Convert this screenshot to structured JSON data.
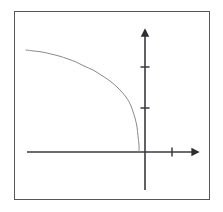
{
  "figure": {
    "title": "",
    "background_color": "#ffffff",
    "frame": {
      "name": "plot-border",
      "color": "#55555a",
      "x": 14,
      "y": 11,
      "width": 196,
      "height": 189
    }
  },
  "chart_data": {
    "type": "line",
    "title": "",
    "subtitle": "",
    "xlabel": "",
    "ylabel": "",
    "grid": false,
    "legend": "none",
    "axis_style": "arrowed-cartesian",
    "xlim": [
      -4.2,
      1.6
    ],
    "ylim": [
      -1.4,
      3.4
    ],
    "origin_px": {
      "x": 145,
      "y": 152
    },
    "axes": {
      "x_axis": {
        "name": "x-axis",
        "color": "#3a3a3f",
        "start_px": {
          "x": 27,
          "y": 152
        },
        "end_px": {
          "x": 198,
          "y": 152
        },
        "arrow_at": "end",
        "ticks": [
          {
            "label": "",
            "x_px": 172,
            "value": 0.8
          }
        ]
      },
      "y_axis": {
        "name": "y-axis",
        "color": "#3a3a3f",
        "start_px": {
          "x": 145,
          "y": 190
        },
        "end_px": {
          "x": 145,
          "y": 30
        },
        "arrow_at": "end",
        "ticks": [
          {
            "label": "",
            "y_px": 108,
            "value": 1.0
          },
          {
            "label": "",
            "y_px": 67,
            "value": 2.0
          }
        ]
      }
    },
    "series": [
      {
        "name": "curve",
        "color": "#8a8a90",
        "line_width": 1,
        "description": "decreasing concave curve from upper-left falling steeply to the x-axis just left of the origin",
        "x": [
          -4.0,
          -3.75,
          -3.5,
          -3.25,
          -3.0,
          -2.75,
          -2.5,
          -2.25,
          -2.0,
          -1.75,
          -1.5,
          -1.25,
          -1.0,
          -0.75,
          -0.5,
          -0.35,
          -0.2,
          -0.1,
          -0.05
        ],
        "y": [
          3.0,
          2.96,
          2.92,
          2.86,
          2.79,
          2.71,
          2.61,
          2.5,
          2.37,
          2.22,
          2.04,
          1.83,
          1.58,
          1.3,
          0.97,
          0.74,
          0.48,
          0.26,
          0.05
        ],
        "points_px": [
          {
            "x": 26,
            "y": 50
          },
          {
            "x": 34,
            "y": 51
          },
          {
            "x": 42,
            "y": 52
          },
          {
            "x": 51,
            "y": 54
          },
          {
            "x": 59,
            "y": 56
          },
          {
            "x": 68,
            "y": 59
          },
          {
            "x": 76,
            "y": 62
          },
          {
            "x": 84,
            "y": 66
          },
          {
            "x": 93,
            "y": 70
          },
          {
            "x": 101,
            "y": 75
          },
          {
            "x": 110,
            "y": 81
          },
          {
            "x": 118,
            "y": 88
          },
          {
            "x": 126,
            "y": 97
          },
          {
            "x": 131,
            "y": 106
          },
          {
            "x": 135,
            "y": 118
          },
          {
            "x": 137,
            "y": 127
          },
          {
            "x": 138,
            "y": 136
          },
          {
            "x": 139,
            "y": 145
          },
          {
            "x": 139,
            "y": 152
          }
        ]
      }
    ]
  }
}
